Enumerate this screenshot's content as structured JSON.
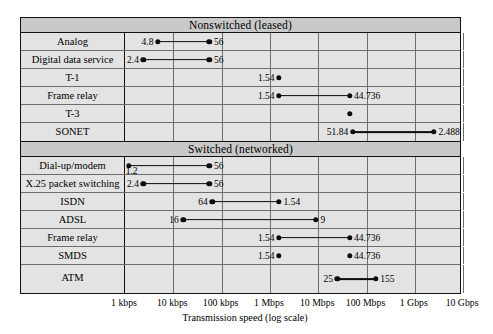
{
  "chart_data": {
    "type": "bar",
    "title": "",
    "xlabel": "Transmission speed (log scale)",
    "ylabel": "",
    "scale": "log",
    "xlim_kbps": [
      1,
      10000000
    ],
    "grid": true,
    "tick_labels": [
      "1 kbps",
      "10 kbps",
      "100 kbps",
      "1 Mbps",
      "10 Mbps",
      "100 Mbps",
      "1 Gbps",
      "10 Gbps"
    ],
    "tick_values_kbps": [
      1,
      10,
      100,
      1000,
      10000,
      100000,
      1000000,
      10000000
    ],
    "groups": [
      {
        "name": "Nonswitched (leased)",
        "rows": [
          {
            "label": "Analog",
            "start_kbps": 4.8,
            "end_kbps": 56,
            "start_label": "4.8",
            "end_label": "56",
            "start_pos": "left",
            "end_pos": "right"
          },
          {
            "label": "Digital data service",
            "start_kbps": 2.4,
            "end_kbps": 56,
            "start_label": "2.4",
            "end_label": "56",
            "start_pos": "left",
            "end_pos": "right"
          },
          {
            "label": "T-1",
            "start_kbps": 1540,
            "end_kbps": 1540,
            "start_label": "1.54",
            "end_label": "",
            "start_pos": "left",
            "end_pos": "right"
          },
          {
            "label": "Frame relay",
            "start_kbps": 1540,
            "end_kbps": 44736,
            "start_label": "1.54",
            "end_label": "44.736",
            "start_pos": "left",
            "end_pos": "right"
          },
          {
            "label": "T-3",
            "start_kbps": 44736,
            "end_kbps": 44736,
            "start_label": "",
            "end_label": "44.736",
            "start_pos": "left",
            "end_pos": "right"
          },
          {
            "label": "SONET",
            "start_kbps": 51840,
            "end_kbps": 2488000,
            "start_label": "51.84",
            "end_label": "2.488",
            "start_pos": "left",
            "end_pos": "right"
          }
        ]
      },
      {
        "name": "Switched (networked)",
        "rows": [
          {
            "label": "X.25 packet switching",
            "start_kbps": 2.4,
            "end_kbps": 56,
            "start_label": "2.4",
            "end_label": "56",
            "start_pos": "left",
            "end_pos": "right"
          },
          {
            "label": "ISDN",
            "start_kbps": 64,
            "end_kbps": 1540,
            "start_label": "64",
            "end_label": "1.54",
            "start_pos": "left",
            "end_pos": "right"
          },
          {
            "label": "ADSL",
            "start_kbps": 16,
            "end_kbps": 9000,
            "start_label": "16",
            "end_label": "9",
            "start_pos": "left",
            "end_pos": "right"
          },
          {
            "label": "Frame relay",
            "start_kbps": 1540,
            "end_kbps": 44736,
            "start_label": "1.54",
            "end_label": "44.736",
            "start_pos": "left",
            "end_pos": "right"
          },
          {
            "label": "SMDS",
            "start_kbps": 1540,
            "end_kbps": 44736,
            "start_label": "1.54",
            "end_label": "44.736",
            "start_pos": "left",
            "end_pos": "right",
            "no_bar": true
          },
          {
            "label": "ATM",
            "start_kbps": 25000,
            "end_kbps": 155000,
            "start_label": "25",
            "end_label": "155",
            "start_pos": "left",
            "end_pos": "right"
          }
        ],
        "special_first_row": {
          "label": "Dial-up/modem",
          "start_kbps": 1.2,
          "end_kbps": 56,
          "start_label": "1.2",
          "end_label": "56",
          "start_pos": "below",
          "end_pos": "right"
        }
      }
    ]
  },
  "colors": {
    "mark": "#0d0d0d",
    "row_fill": "#e3e3e3",
    "header_fill": "#c9c9c9",
    "border": "#111111",
    "gridline": "#6d6d6d"
  }
}
